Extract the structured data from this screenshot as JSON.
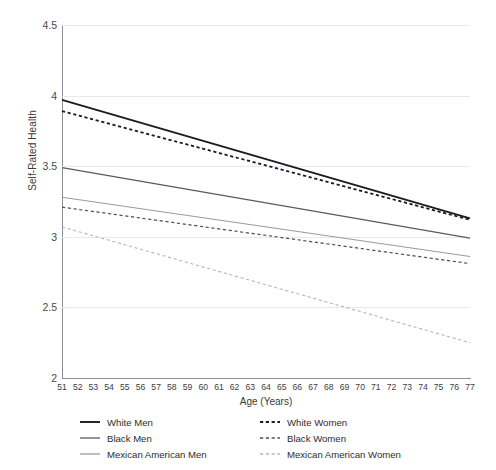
{
  "chart_data": {
    "type": "line",
    "title": "",
    "xlabel": "Age (Years)",
    "ylabel": "Self-Rated Health",
    "xlim": [
      51,
      77
    ],
    "ylim": [
      2,
      4.5
    ],
    "grid": true,
    "legend_position": "bottom",
    "x_ticks": [
      51,
      52,
      53,
      54,
      55,
      56,
      57,
      58,
      59,
      60,
      61,
      62,
      63,
      64,
      65,
      66,
      67,
      68,
      69,
      70,
      71,
      72,
      73,
      74,
      75,
      76,
      77
    ],
    "y_ticks": [
      "2",
      "2.5",
      "3",
      "3.5",
      "4",
      "4.5"
    ],
    "y_tick_values": [
      2,
      2.5,
      3,
      3.5,
      4,
      4.5
    ],
    "x": [
      51,
      77
    ],
    "series": [
      {
        "name": "White Men",
        "style": "solid",
        "color": "#1b1b22",
        "width": 1.9,
        "values": [
          3.97,
          3.13
        ]
      },
      {
        "name": "White Women",
        "style": "dashed",
        "color": "#1b1b28",
        "width": 1.8,
        "values": [
          3.89,
          3.12
        ]
      },
      {
        "name": "Black Men",
        "style": "solid",
        "color": "#5a5a66",
        "width": 1.2,
        "values": [
          3.49,
          2.99
        ]
      },
      {
        "name": "Black Women",
        "style": "dashed",
        "color": "#4e4e5a",
        "width": 1.2,
        "values": [
          3.21,
          2.81
        ]
      },
      {
        "name": "Mexican American Men",
        "style": "solid",
        "color": "#9a9aa6",
        "width": 1.1,
        "values": [
          3.28,
          2.86
        ]
      },
      {
        "name": "Mexican American Women",
        "style": "dashed",
        "color": "#b4b4c0",
        "width": 1.1,
        "values": [
          3.07,
          2.25
        ]
      }
    ]
  },
  "legend": {
    "columns": [
      {
        "entries": [
          {
            "label": "White Men",
            "series_index": 0
          },
          {
            "label": "Black Men",
            "series_index": 2
          },
          {
            "label": "Mexican American Men",
            "series_index": 4
          }
        ]
      },
      {
        "entries": [
          {
            "label": "White Women",
            "series_index": 1
          },
          {
            "label": "Black Women",
            "series_index": 3
          },
          {
            "label": "Mexican American Women",
            "series_index": 5
          }
        ]
      }
    ]
  },
  "colors": {
    "gridline": "#e7e8f2",
    "axis": "#8d8d95",
    "text": "#2c2c2c",
    "background": "#ffffff"
  }
}
